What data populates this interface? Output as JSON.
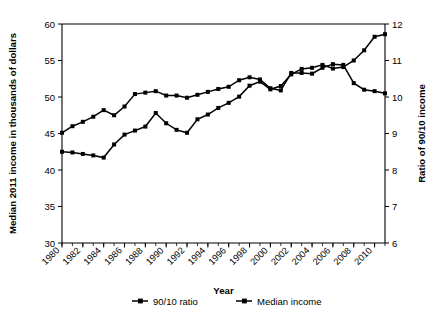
{
  "chart_data": {
    "type": "line",
    "title": "",
    "xlabel": "Year",
    "ylabel": "Median 2011 income in thousands of dollars",
    "ylabel_right": "Ratio of 90/10 income",
    "grid": false,
    "legend_position": "bottom",
    "xlim": [
      1980,
      2011
    ],
    "ylim": [
      30,
      60
    ],
    "ylim_right": [
      6,
      12
    ],
    "yticks": [
      30,
      35,
      40,
      45,
      50,
      55,
      60
    ],
    "yticks_right": [
      6,
      7,
      8,
      9,
      10,
      11,
      12
    ],
    "xticks": [
      1980,
      1982,
      1984,
      1986,
      1988,
      1990,
      1992,
      1994,
      1996,
      1998,
      2000,
      2002,
      2004,
      2006,
      2008,
      2010
    ],
    "xticks_minor_every": 1,
    "x": [
      1980,
      1981,
      1982,
      1983,
      1984,
      1985,
      1986,
      1987,
      1988,
      1989,
      1990,
      1991,
      1992,
      1993,
      1994,
      1995,
      1996,
      1997,
      1998,
      1999,
      2000,
      2001,
      2002,
      2003,
      2004,
      2005,
      2006,
      2007,
      2008,
      2009,
      2010,
      2011
    ],
    "series": [
      {
        "name": "Median income",
        "axis": "left",
        "marker": "square",
        "values": [
          45.1,
          46.0,
          46.6,
          47.3,
          48.2,
          47.5,
          48.7,
          50.4,
          50.6,
          50.8,
          50.2,
          50.2,
          49.9,
          50.3,
          50.7,
          51.1,
          51.4,
          52.3,
          52.7,
          52.4,
          51.2,
          50.9,
          53.3,
          53.3,
          53.2,
          54.0,
          54.5,
          54.4,
          51.9,
          51.0,
          50.8,
          50.5
        ]
      },
      {
        "name": "90/10 ratio",
        "axis": "right",
        "marker": "square",
        "values": [
          8.5,
          8.48,
          8.44,
          8.4,
          8.34,
          8.7,
          8.97,
          9.08,
          9.19,
          9.56,
          9.28,
          9.1,
          9.02,
          9.39,
          9.52,
          9.7,
          9.84,
          10.01,
          10.31,
          10.42,
          10.21,
          10.3,
          10.62,
          10.77,
          10.8,
          10.88,
          10.78,
          10.82,
          11.0,
          11.28,
          11.65,
          11.72
        ]
      }
    ],
    "legend": [
      {
        "label": "90/10 ratio",
        "marker": "square-line"
      },
      {
        "label": "Median income",
        "marker": "square-line"
      }
    ]
  }
}
